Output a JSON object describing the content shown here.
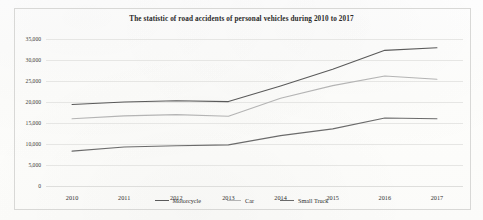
{
  "figure": {
    "width": 483,
    "height": 220,
    "background_color": "#fdfdfc",
    "frame_color": "#d8d8d6"
  },
  "chart_data": {
    "type": "line",
    "title": "The statistic of road accidents of personal vehicles during 2010 to 2017",
    "xlabel": "",
    "ylabel": "",
    "categories": [
      "2010",
      "2011",
      "2012",
      "2013",
      "2014",
      "2015",
      "2016",
      "2017"
    ],
    "x": [
      2010,
      2011,
      2012,
      2013,
      2014,
      2015,
      2016,
      2017
    ],
    "ylim": [
      0,
      35000
    ],
    "yticks": [
      0,
      5000,
      10000,
      15000,
      20000,
      25000,
      30000,
      35000
    ],
    "ytick_labels": [
      "0",
      "5,000",
      "10,000",
      "15,000",
      "20,000",
      "25,000",
      "30,000",
      "35,000"
    ],
    "grid": true,
    "grid_color": "#e6e6e4",
    "legend_position": "bottom",
    "series": [
      {
        "name": "Motorcycle",
        "color": "#5a5a5a",
        "values": [
          19400,
          20000,
          20300,
          20100,
          23800,
          27800,
          32300,
          32900
        ]
      },
      {
        "name": "Car",
        "color": "#b4b4b4",
        "values": [
          16000,
          16700,
          17000,
          16600,
          20900,
          23900,
          26200,
          25400
        ]
      },
      {
        "name": "Small Truck",
        "color": "#6b6b6b",
        "values": [
          8300,
          9300,
          9600,
          9800,
          12000,
          13600,
          16200,
          16000
        ]
      }
    ]
  },
  "legend": {
    "items": [
      {
        "label": "Motorcycle",
        "color": "#5a5a5a"
      },
      {
        "label": "Car",
        "color": "#b4b4b4"
      },
      {
        "label": "Small Truck",
        "color": "#6b6b6b"
      }
    ]
  }
}
